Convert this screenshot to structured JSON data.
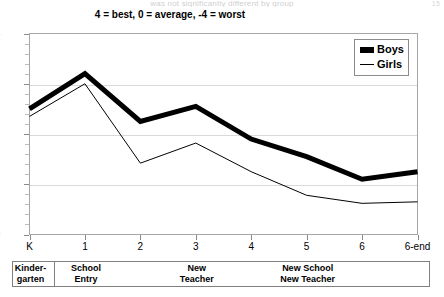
{
  "top_cutoff": {
    "text": "was not significantly different by group",
    "edge_mark": "15"
  },
  "chart_data": {
    "type": "line",
    "title": "4 = best, 0 = average, -4 = worst",
    "xlabel": "",
    "ylabel": "",
    "categories": [
      "K",
      "1",
      "2",
      "3",
      "4",
      "5",
      "6",
      "6-end"
    ],
    "ylim": [
      0,
      4
    ],
    "yticks": [
      0,
      1,
      2,
      3,
      4
    ],
    "ytick_labels": [
      "0",
      "1",
      "2",
      "3",
      "4"
    ],
    "grid": true,
    "legend_position": "top-right",
    "series": [
      {
        "name": "Boys",
        "style": "thick",
        "values": [
          2.5,
          3.2,
          2.25,
          2.55,
          1.9,
          1.55,
          1.1,
          1.25
        ]
      },
      {
        "name": "Girls",
        "style": "thin",
        "values": [
          2.35,
          3.0,
          1.42,
          1.82,
          1.25,
          0.78,
          0.62,
          0.65
        ]
      }
    ],
    "annotations": [
      {
        "label": "Kinder-\ngarten",
        "start": "K",
        "end": "K"
      },
      {
        "label": "School\nEntry",
        "start": "1",
        "end": "1"
      },
      {
        "label": "New\nTeacher",
        "start": "3",
        "end": "3"
      },
      {
        "label": "New School\nNew Teacher",
        "start": "5",
        "end": "5"
      }
    ]
  }
}
